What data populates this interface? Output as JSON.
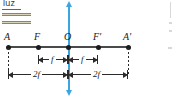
{
  "diagram": {
    "source_label": {
      "text": "luz",
      "arrow_count": 2,
      "direction": "right"
    },
    "axis": {
      "points": [
        {
          "id": "A",
          "label": "A",
          "x": 8,
          "has_dashed_extension": true
        },
        {
          "id": "F",
          "label": "F",
          "x": 38,
          "has_dashed_extension": false
        },
        {
          "id": "O",
          "label": "O",
          "x": 68,
          "has_dashed_extension": false
        },
        {
          "id": "F1",
          "label": "F'",
          "x": 98,
          "has_dashed_extension": false
        },
        {
          "id": "A1",
          "label": "A'",
          "x": 128,
          "has_dashed_extension": true
        }
      ]
    },
    "lens_axis": {
      "color": "#3aa6e0",
      "orientation": "vertical",
      "double_headed": true
    },
    "dimensions": [
      {
        "id": "f-left",
        "label": "f",
        "from": "F",
        "to": "O"
      },
      {
        "id": "f-right",
        "label": "f",
        "from": "O",
        "to": "F'"
      },
      {
        "id": "2f-left",
        "label": "2f",
        "from": "A",
        "to": "O"
      },
      {
        "id": "2f-right",
        "label": "2f",
        "from": "O",
        "to": "A'"
      }
    ],
    "colors": {
      "axis": "#4a4a4a",
      "lens_axis": "#3aa6e0",
      "dimension": "#2b2b2b",
      "light_arrow": "#8c8670",
      "background": "#ffffff"
    }
  }
}
